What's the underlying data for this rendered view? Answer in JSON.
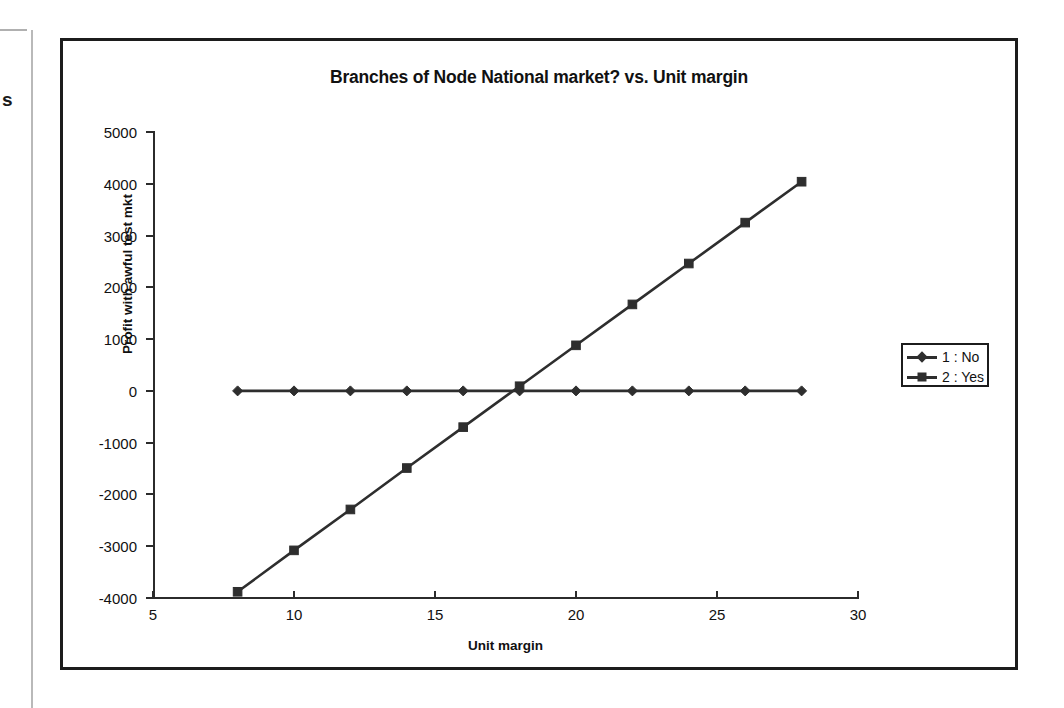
{
  "page_artifacts": {
    "edge_text": "s"
  },
  "chart_data": {
    "type": "line",
    "title": "Branches of Node National market? vs. Unit margin",
    "xlabel": "Unit margin",
    "ylabel": "Profit with awful test mkt",
    "xlim": [
      5,
      30
    ],
    "ylim": [
      -4000,
      5000
    ],
    "xticks": [
      5,
      10,
      15,
      20,
      25,
      30
    ],
    "xtick_labels": [
      "5",
      "10",
      "15",
      "20",
      "25",
      "30"
    ],
    "yticks": [
      5000,
      4000,
      3000,
      2000,
      1000,
      0,
      -1000,
      -2000,
      -3000,
      -4000
    ],
    "ytick_labels": [
      "5000",
      "4000",
      "3000",
      "2000",
      "1000",
      "0",
      "-1000",
      "-2000",
      "-3000",
      "-4000"
    ],
    "grid": false,
    "legend_position": "right",
    "x": [
      8,
      10,
      12,
      14,
      16,
      18,
      20,
      22,
      24,
      26,
      28
    ],
    "series": [
      {
        "name": "1 : No",
        "marker": "diamond",
        "color": "#2e2e2e",
        "values": [
          0,
          0,
          0,
          0,
          0,
          0,
          0,
          0,
          0,
          0,
          0
        ]
      },
      {
        "name": "2 : Yes",
        "marker": "square",
        "color": "#2e2e2e",
        "values": [
          -3880,
          -3080,
          -2290,
          -1490,
          -700,
          90,
          880,
          1670,
          2460,
          3250,
          4040
        ]
      }
    ]
  },
  "legend": {
    "entries": [
      {
        "label": "1 : No",
        "marker": "diamond"
      },
      {
        "label": "2 : Yes",
        "marker": "square"
      }
    ]
  }
}
